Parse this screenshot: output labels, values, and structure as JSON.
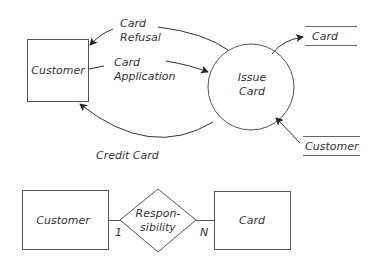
{
  "dfd": {
    "external_entity": {
      "label": "Customer"
    },
    "process": {
      "line1": "Issue",
      "line2": "Card"
    },
    "data_stores": [
      {
        "label": "Card"
      },
      {
        "label": "Customer"
      }
    ],
    "flows": {
      "card_refusal": {
        "line1": "Card",
        "line2": "Refusal"
      },
      "card_application": {
        "line1": "Card",
        "line2": "Application"
      },
      "credit_card": {
        "label": "Credit Card"
      }
    }
  },
  "er": {
    "entity_left": {
      "label": "Customer"
    },
    "relationship": {
      "line1": "Respon-",
      "line2": "sibility"
    },
    "entity_right": {
      "label": "Card"
    },
    "cardinality_left": "1",
    "cardinality_right": "N"
  },
  "colors": {
    "stroke": "#555555",
    "text": "#333333",
    "background": "#ffffff"
  }
}
